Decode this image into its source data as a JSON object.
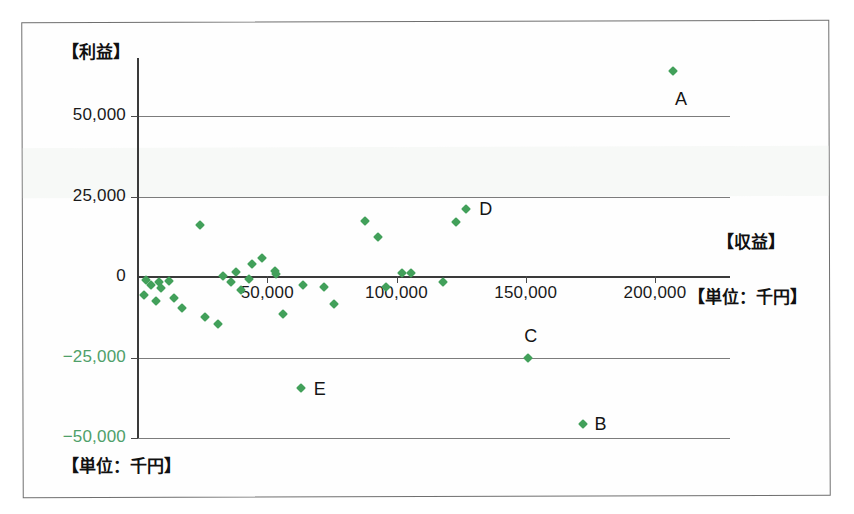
{
  "chart_data": {
    "type": "scatter",
    "title": "",
    "xlabel": "【収益】",
    "ylabel": "【利益】",
    "unit_note_x": "【単位：千円】",
    "unit_note_y": "【単位：千円】",
    "xlim": [
      0,
      215000
    ],
    "ylim": [
      -50000,
      68000
    ],
    "xticks": [
      0,
      50000,
      100000,
      150000,
      200000
    ],
    "xtick_labels": [
      "0",
      "50,000",
      "100,000",
      "150,000",
      "200,000"
    ],
    "yticks": [
      50000,
      25000,
      0,
      -25000,
      -50000
    ],
    "ytick_labels": [
      "50,000",
      "25,000",
      "0",
      "−25,000",
      "−50,000"
    ],
    "grid": "horizontal",
    "legend": "none",
    "marker": "diamond",
    "marker_color": "#42a05a",
    "negative_label_color": "#4fa06a",
    "annotations": [
      {
        "label": "A",
        "x": 207000,
        "y": 64000
      },
      {
        "label": "B",
        "x": 172000,
        "y": -45500
      },
      {
        "label": "C",
        "x": 151000,
        "y": -25000
      },
      {
        "label": "D",
        "x": 127000,
        "y": 21000
      },
      {
        "label": "E",
        "x": 63000,
        "y": -34500
      }
    ],
    "points": [
      {
        "x": 207000,
        "y": 64000,
        "label": "A"
      },
      {
        "x": 127000,
        "y": 21000,
        "label": "D"
      },
      {
        "x": 123000,
        "y": 17000,
        "label": ""
      },
      {
        "x": 151000,
        "y": -25000,
        "label": "C"
      },
      {
        "x": 172000,
        "y": -45500,
        "label": "B"
      },
      {
        "x": 63000,
        "y": -34500,
        "label": "E"
      },
      {
        "x": 88000,
        "y": 17500,
        "label": ""
      },
      {
        "x": 93000,
        "y": 12500,
        "label": ""
      },
      {
        "x": 24000,
        "y": 16000,
        "label": ""
      },
      {
        "x": 48000,
        "y": 6000,
        "label": ""
      },
      {
        "x": 44000,
        "y": 4000,
        "label": ""
      },
      {
        "x": 53000,
        "y": 2000,
        "label": ""
      },
      {
        "x": 53500,
        "y": 800,
        "label": ""
      },
      {
        "x": 38000,
        "y": 1500,
        "label": ""
      },
      {
        "x": 33000,
        "y": 300,
        "label": ""
      },
      {
        "x": 43000,
        "y": -500,
        "label": ""
      },
      {
        "x": 36000,
        "y": -1500,
        "label": ""
      },
      {
        "x": 40000,
        "y": -4000,
        "label": ""
      },
      {
        "x": 3000,
        "y": -1000,
        "label": ""
      },
      {
        "x": 5000,
        "y": -2500,
        "label": ""
      },
      {
        "x": 8000,
        "y": -1500,
        "label": ""
      },
      {
        "x": 9000,
        "y": -3500,
        "label": ""
      },
      {
        "x": 12000,
        "y": -1200,
        "label": ""
      },
      {
        "x": 2500,
        "y": -5500,
        "label": ""
      },
      {
        "x": 7000,
        "y": -7500,
        "label": ""
      },
      {
        "x": 14000,
        "y": -6500,
        "label": ""
      },
      {
        "x": 17000,
        "y": -9500,
        "label": ""
      },
      {
        "x": 26000,
        "y": -12500,
        "label": ""
      },
      {
        "x": 31000,
        "y": -14500,
        "label": ""
      },
      {
        "x": 56000,
        "y": -11500,
        "label": ""
      },
      {
        "x": 64000,
        "y": -2500,
        "label": ""
      },
      {
        "x": 72000,
        "y": -3000,
        "label": ""
      },
      {
        "x": 76000,
        "y": -8500,
        "label": ""
      },
      {
        "x": 102000,
        "y": 1200,
        "label": ""
      },
      {
        "x": 105500,
        "y": 1200,
        "label": ""
      },
      {
        "x": 118000,
        "y": -1500,
        "label": ""
      },
      {
        "x": 96000,
        "y": -3000,
        "label": ""
      }
    ]
  },
  "axes": {
    "y_title": "【利益】",
    "x_title": "【収益】",
    "x_unit": "【単位：千円】",
    "bottom_unit": "【単位：千円】"
  }
}
